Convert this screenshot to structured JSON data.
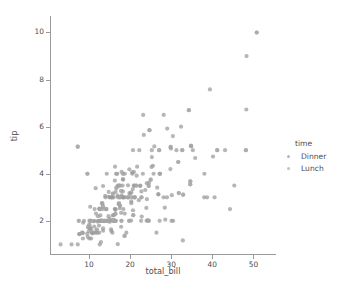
{
  "chart_data": {
    "type": "scatter",
    "title": "",
    "xlabel": "total_bill",
    "ylabel": "tip",
    "xlim": [
      0.5,
      55.5
    ],
    "ylim": [
      0.55,
      10.7
    ],
    "xticks": [
      10,
      20,
      30,
      40,
      50
    ],
    "yticks": [
      2,
      4,
      6,
      8,
      10
    ],
    "xtick_labels": [
      "10",
      "20",
      "30",
      "40",
      "50"
    ],
    "ytick_labels": [
      "2",
      "4",
      "6",
      "8",
      "10"
    ],
    "grid": false,
    "legend": {
      "title": "time",
      "position": "right",
      "entries": [
        {
          "label": "Dinner",
          "color": "#9a9a9a"
        },
        {
          "label": "Lunch",
          "color": "#a8a8a8"
        }
      ]
    },
    "marker": {
      "shape": "circle",
      "size_px": 4.2,
      "opacity": 0.72,
      "edge_color": "none"
    },
    "series": [
      {
        "name": "Dinner",
        "color": "#9a9a9a",
        "points": [
          [
            16.99,
            1.01
          ],
          [
            10.34,
            1.66
          ],
          [
            21.01,
            3.5
          ],
          [
            23.68,
            3.31
          ],
          [
            24.59,
            3.61
          ],
          [
            25.29,
            4.71
          ],
          [
            8.77,
            2.0
          ],
          [
            26.88,
            3.12
          ],
          [
            15.04,
            1.96
          ],
          [
            14.78,
            3.23
          ],
          [
            10.27,
            1.71
          ],
          [
            35.26,
            5.0
          ],
          [
            15.42,
            1.57
          ],
          [
            18.43,
            3.0
          ],
          [
            14.83,
            3.02
          ],
          [
            21.58,
            3.92
          ],
          [
            10.33,
            1.67
          ],
          [
            16.29,
            3.71
          ],
          [
            16.97,
            3.5
          ],
          [
            20.65,
            3.35
          ],
          [
            17.92,
            4.08
          ],
          [
            20.29,
            2.75
          ],
          [
            15.77,
            2.23
          ],
          [
            39.42,
            7.58
          ],
          [
            19.82,
            3.18
          ],
          [
            17.81,
            2.34
          ],
          [
            13.37,
            2.0
          ],
          [
            12.69,
            2.0
          ],
          [
            21.7,
            4.3
          ],
          [
            19.65,
            3.0
          ],
          [
            9.55,
            1.45
          ],
          [
            18.35,
            2.5
          ],
          [
            15.06,
            3.0
          ],
          [
            20.69,
            2.45
          ],
          [
            17.78,
            3.27
          ],
          [
            24.06,
            3.6
          ],
          [
            16.31,
            2.0
          ],
          [
            16.93,
            3.07
          ],
          [
            18.69,
            2.31
          ],
          [
            31.27,
            5.0
          ],
          [
            16.04,
            2.24
          ],
          [
            17.46,
            2.54
          ],
          [
            13.94,
            3.06
          ],
          [
            9.68,
            1.32
          ],
          [
            30.4,
            5.6
          ],
          [
            18.29,
            3.0
          ],
          [
            22.23,
            5.0
          ],
          [
            32.4,
            6.0
          ],
          [
            28.55,
            2.05
          ],
          [
            18.04,
            3.0
          ],
          [
            12.54,
            2.5
          ],
          [
            10.29,
            2.6
          ],
          [
            34.81,
            5.2
          ],
          [
            9.94,
            1.56
          ],
          [
            25.56,
            4.34
          ],
          [
            19.49,
            3.51
          ],
          [
            38.01,
            3.0
          ],
          [
            26.41,
            1.5
          ],
          [
            11.24,
            1.76
          ],
          [
            48.27,
            6.73
          ],
          [
            20.29,
            3.21
          ],
          [
            13.81,
            2.0
          ],
          [
            11.02,
            1.98
          ],
          [
            18.29,
            3.76
          ],
          [
            17.59,
            2.64
          ],
          [
            20.08,
            3.15
          ],
          [
            16.45,
            2.47
          ],
          [
            3.07,
            1.0
          ],
          [
            20.23,
            2.01
          ],
          [
            15.01,
            2.09
          ],
          [
            12.02,
            1.97
          ],
          [
            17.07,
            3.0
          ],
          [
            26.86,
            3.14
          ],
          [
            25.28,
            5.0
          ],
          [
            14.73,
            2.2
          ],
          [
            10.51,
            1.25
          ],
          [
            17.92,
            3.08
          ],
          [
            27.2,
            4.0
          ],
          [
            22.76,
            3.0
          ],
          [
            17.29,
            2.71
          ],
          [
            19.44,
            3.0
          ],
          [
            16.66,
            3.4
          ],
          [
            10.07,
            1.83
          ],
          [
            32.68,
            5.0
          ],
          [
            15.98,
            2.03
          ],
          [
            34.83,
            5.17
          ],
          [
            13.03,
            2.0
          ],
          [
            18.28,
            4.0
          ],
          [
            24.71,
            5.85
          ],
          [
            21.16,
            3.0
          ],
          [
            28.97,
            3.0
          ],
          [
            22.49,
            3.5
          ],
          [
            5.75,
            1.0
          ],
          [
            16.32,
            4.3
          ],
          [
            22.75,
            3.25
          ],
          [
            40.17,
            4.73
          ],
          [
            27.28,
            4.0
          ],
          [
            12.03,
            1.5
          ],
          [
            21.01,
            3.0
          ],
          [
            12.46,
            1.5
          ],
          [
            11.35,
            2.5
          ],
          [
            15.38,
            3.0
          ],
          [
            44.3,
            2.5
          ],
          [
            22.42,
            3.48
          ],
          [
            20.92,
            4.08
          ],
          [
            15.36,
            1.64
          ],
          [
            20.49,
            4.06
          ],
          [
            25.21,
            4.29
          ],
          [
            18.24,
            3.76
          ],
          [
            14.31,
            4.0
          ],
          [
            14.0,
            3.0
          ],
          [
            7.25,
            1.0
          ],
          [
            38.07,
            4.0
          ],
          [
            23.95,
            2.55
          ],
          [
            25.71,
            4.0
          ],
          [
            17.31,
            3.5
          ],
          [
            29.93,
            5.07
          ],
          [
            10.65,
            1.5
          ],
          [
            12.43,
            1.8
          ],
          [
            24.08,
            2.92
          ],
          [
            11.69,
            2.31
          ],
          [
            13.42,
            1.68
          ],
          [
            14.26,
            2.5
          ],
          [
            15.95,
            2.0
          ],
          [
            12.48,
            2.52
          ],
          [
            29.8,
            4.2
          ],
          [
            8.52,
            1.48
          ],
          [
            14.52,
            2.0
          ],
          [
            11.38,
            2.0
          ],
          [
            22.82,
            2.18
          ],
          [
            19.08,
            1.5
          ],
          [
            20.27,
            2.83
          ],
          [
            11.17,
            1.5
          ],
          [
            12.26,
            2.0
          ],
          [
            18.26,
            3.25
          ],
          [
            8.51,
            1.25
          ],
          [
            10.33,
            2.0
          ],
          [
            14.15,
            2.0
          ],
          [
            16.0,
            2.0
          ],
          [
            13.16,
            2.75
          ],
          [
            17.47,
            3.5
          ],
          [
            34.3,
            6.7
          ],
          [
            41.19,
            5.0
          ],
          [
            27.05,
            5.0
          ],
          [
            16.43,
            2.3
          ],
          [
            8.35,
            1.5
          ],
          [
            18.64,
            1.36
          ],
          [
            11.87,
            1.63
          ],
          [
            9.78,
            1.73
          ],
          [
            7.51,
            2.0
          ],
          [
            14.07,
            2.5
          ],
          [
            13.13,
            2.0
          ],
          [
            17.26,
            2.74
          ],
          [
            24.55,
            2.0
          ],
          [
            19.77,
            2.0
          ],
          [
            29.85,
            5.14
          ],
          [
            48.17,
            5.0
          ],
          [
            25.0,
            3.75
          ],
          [
            13.39,
            2.61
          ],
          [
            16.49,
            2.0
          ],
          [
            21.5,
            3.5
          ],
          [
            12.66,
            2.5
          ],
          [
            16.21,
            2.0
          ],
          [
            13.81,
            2.0
          ],
          [
            17.51,
            3.0
          ],
          [
            24.52,
            3.48
          ],
          [
            20.76,
            2.24
          ],
          [
            31.71,
            4.5
          ],
          [
            50.81,
            10.0
          ],
          [
            15.81,
            3.16
          ],
          [
            7.25,
            5.15
          ],
          [
            31.85,
            3.18
          ],
          [
            16.82,
            4.0
          ],
          [
            32.9,
            3.11
          ],
          [
            17.89,
            2.0
          ],
          [
            14.48,
            2.0
          ],
          [
            9.6,
            4.0
          ],
          [
            34.63,
            3.55
          ],
          [
            34.65,
            3.68
          ],
          [
            23.33,
            5.65
          ],
          [
            45.35,
            3.5
          ],
          [
            23.17,
            6.5
          ],
          [
            40.55,
            3.0
          ],
          [
            20.69,
            5.0
          ],
          [
            20.9,
            3.5
          ],
          [
            30.46,
            2.0
          ],
          [
            18.15,
            3.5
          ],
          [
            23.1,
            4.0
          ],
          [
            15.69,
            1.5
          ],
          [
            19.81,
            4.19
          ],
          [
            28.44,
            2.56
          ],
          [
            15.48,
            2.02
          ],
          [
            16.58,
            4.0
          ],
          [
            7.56,
            1.44
          ],
          [
            10.34,
            2.0
          ],
          [
            43.11,
            5.0
          ],
          [
            13.0,
            2.0
          ],
          [
            13.51,
            2.0
          ],
          [
            18.71,
            4.0
          ],
          [
            12.74,
            2.01
          ],
          [
            13.0,
            2.0
          ],
          [
            16.4,
            2.5
          ],
          [
            20.53,
            4.0
          ],
          [
            16.47,
            3.23
          ],
          [
            26.59,
            3.41
          ],
          [
            38.73,
            3.0
          ],
          [
            24.27,
            2.03
          ],
          [
            12.76,
            2.23
          ],
          [
            30.06,
            2.0
          ],
          [
            25.89,
            5.16
          ],
          [
            48.33,
            9.0
          ],
          [
            13.27,
            2.5
          ],
          [
            28.17,
            6.5
          ],
          [
            12.9,
            1.1
          ],
          [
            28.15,
            3.0
          ],
          [
            11.59,
            1.5
          ],
          [
            7.74,
            1.44
          ],
          [
            30.14,
            3.09
          ],
          [
            12.16,
            2.2
          ],
          [
            13.42,
            3.48
          ],
          [
            8.58,
            1.92
          ],
          [
            15.98,
            3.0
          ],
          [
            13.42,
            1.58
          ],
          [
            16.27,
            2.5
          ],
          [
            10.09,
            2.0
          ],
          [
            20.45,
            3.0
          ],
          [
            13.28,
            2.72
          ],
          [
            22.12,
            2.88
          ],
          [
            24.01,
            2.0
          ],
          [
            15.69,
            3.0
          ],
          [
            11.61,
            3.39
          ],
          [
            10.77,
            1.47
          ],
          [
            15.53,
            3.0
          ],
          [
            10.07,
            1.25
          ],
          [
            12.6,
            1.0
          ],
          [
            32.83,
            1.17
          ],
          [
            35.83,
            4.67
          ],
          [
            29.03,
            5.92
          ],
          [
            27.18,
            2.0
          ],
          [
            22.67,
            2.0
          ],
          [
            17.82,
            1.75
          ],
          [
            18.78,
            3.0
          ]
        ]
      },
      {
        "name": "Lunch",
        "color": "#a8a8a8",
        "points": [
          [
            27.2,
            4.0
          ],
          [
            22.76,
            3.0
          ],
          [
            17.29,
            2.71
          ],
          [
            19.44,
            3.0
          ],
          [
            16.66,
            3.4
          ],
          [
            10.07,
            1.83
          ],
          [
            32.68,
            5.0
          ],
          [
            15.98,
            2.03
          ],
          [
            34.83,
            5.17
          ],
          [
            13.03,
            2.0
          ],
          [
            18.28,
            4.0
          ],
          [
            24.71,
            5.85
          ],
          [
            21.16,
            3.0
          ],
          [
            10.33,
            2.0
          ],
          [
            14.15,
            2.0
          ],
          [
            16.0,
            2.0
          ],
          [
            13.16,
            2.75
          ],
          [
            17.47,
            3.5
          ],
          [
            34.3,
            6.7
          ],
          [
            41.19,
            5.0
          ],
          [
            27.05,
            5.0
          ],
          [
            16.43,
            2.3
          ],
          [
            8.35,
            1.5
          ],
          [
            18.64,
            1.36
          ],
          [
            11.87,
            1.63
          ],
          [
            9.78,
            1.73
          ],
          [
            7.51,
            2.0
          ],
          [
            14.07,
            2.5
          ],
          [
            13.13,
            2.0
          ],
          [
            17.26,
            2.74
          ],
          [
            24.55,
            2.0
          ],
          [
            19.77,
            2.0
          ],
          [
            29.85,
            5.14
          ],
          [
            48.17,
            5.0
          ],
          [
            25.0,
            3.75
          ],
          [
            13.39,
            2.61
          ],
          [
            16.49,
            2.0
          ],
          [
            21.5,
            3.5
          ],
          [
            12.66,
            2.5
          ],
          [
            16.21,
            2.0
          ],
          [
            13.81,
            2.0
          ],
          [
            17.51,
            3.0
          ],
          [
            24.52,
            3.48
          ],
          [
            20.76,
            2.24
          ],
          [
            31.71,
            4.5
          ],
          [
            10.59,
            1.61
          ],
          [
            10.63,
            2.0
          ],
          [
            50.81,
            10.0
          ],
          [
            15.81,
            3.16
          ],
          [
            7.25,
            5.15
          ],
          [
            31.85,
            3.18
          ],
          [
            16.82,
            4.0
          ],
          [
            32.9,
            3.11
          ],
          [
            17.89,
            2.0
          ],
          [
            14.48,
            2.0
          ],
          [
            9.6,
            4.0
          ],
          [
            34.63,
            3.55
          ],
          [
            34.65,
            3.68
          ]
        ]
      }
    ]
  }
}
